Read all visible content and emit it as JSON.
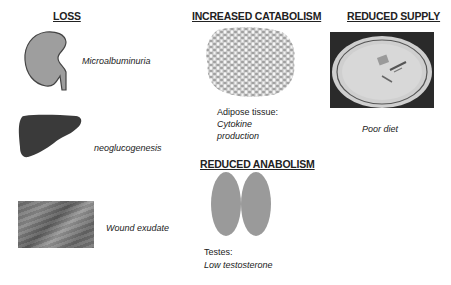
{
  "columns": {
    "loss": {
      "heading": "LOSS",
      "items": [
        {
          "icon": "kidney-icon",
          "caption": "Microalbuminuria"
        },
        {
          "icon": "liver-icon",
          "caption": "neoglucogenesis"
        },
        {
          "icon": "wound-image",
          "caption": "Wound exudate"
        }
      ]
    },
    "increased_catabolism": {
      "heading": "INCREASED CATABOLISM",
      "icon": "adipose-tissue-icon",
      "caption_line1": "Adipose tissue:",
      "caption_line2": "Cytokine",
      "caption_line3": "production"
    },
    "reduced_anabolism": {
      "heading": "REDUCED ANABOLISM",
      "icon": "testes-icon",
      "caption_line1": "Testes:",
      "caption_line2": "Low testosterone"
    },
    "reduced_supply": {
      "heading": "REDUCED SUPPLY",
      "icon": "empty-plate-image",
      "caption": "Poor diet"
    }
  },
  "colors": {
    "kidney_fill": "#9e9e9e",
    "liver_fill": "#3a3a3a",
    "testes_fill": "#9a9a9a",
    "text": "#222222"
  }
}
